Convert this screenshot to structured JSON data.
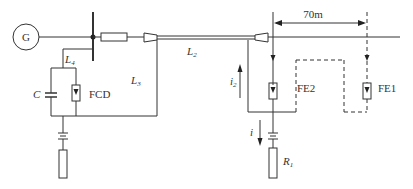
{
  "diagram": {
    "type": "circuit-schematic",
    "colors": {
      "line": "#333333",
      "background": "#ffffff"
    },
    "labels": {
      "generator": "G",
      "line_L2": "L",
      "line_L2_sub": "2",
      "line_L3": "L",
      "line_L3_sub": "3",
      "line_L4": "L",
      "line_L4_sub": "4",
      "capacitor": "C",
      "fcd": "FCD",
      "fe1": "FE1",
      "fe2": "FE2",
      "distance": "70m",
      "current_i2": "i",
      "current_i2_sub": "2",
      "current_i": "i",
      "resistor_R1": "R",
      "resistor_R1_sub": "1"
    }
  }
}
